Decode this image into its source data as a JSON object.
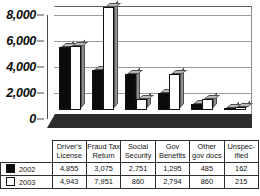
{
  "chart_data": {
    "type": "bar",
    "title": "",
    "xlabel": "",
    "ylabel": "",
    "ylim": [
      0,
      8000
    ],
    "yticks": [
      "0",
      "2,000",
      "4,000",
      "6,000",
      "8,000"
    ],
    "ytick_values": [
      0,
      2000,
      4000,
      6000,
      8000
    ],
    "grid": true,
    "legend_position": "table-left",
    "categories": [
      "Driver's License",
      "Fraud Tax Return",
      "Social Security",
      "Gov Benefits",
      "Other gov docs",
      "Unspecified"
    ],
    "category_lines": [
      [
        "Driver's",
        "License"
      ],
      [
        "Fraud Tax",
        "Return"
      ],
      [
        "Social",
        "Security"
      ],
      [
        "Gov",
        "Benefits"
      ],
      [
        "Other",
        "gov docs"
      ],
      [
        "Unspec-",
        "ified"
      ]
    ],
    "series": [
      {
        "name": "2002",
        "swatch": "filled-black-square",
        "values": [
          4855,
          3075,
          2751,
          1295,
          485,
          162
        ],
        "labels": [
          "4,855",
          "3,075",
          "2,751",
          "1,295",
          "485",
          "162"
        ]
      },
      {
        "name": "2003",
        "swatch": "hollow-white-square",
        "values": [
          4943,
          7951,
          860,
          2794,
          860,
          215
        ],
        "labels": [
          "4,943",
          "7,951",
          "860",
          "2,794",
          "860",
          "215"
        ]
      }
    ]
  },
  "colors": {
    "series_2002": "#0b0b0b",
    "series_2003": "#ffffff",
    "bar_outline": "#111111",
    "bar_top_face": "#b7b7b7",
    "bar_side_face": "#8e8e8e",
    "gridline": "#9a9a9a",
    "axis": "#4a4a4a",
    "floor": "#2c2c2c",
    "table_border": "#2f2f2f",
    "background": "#ffffff"
  }
}
